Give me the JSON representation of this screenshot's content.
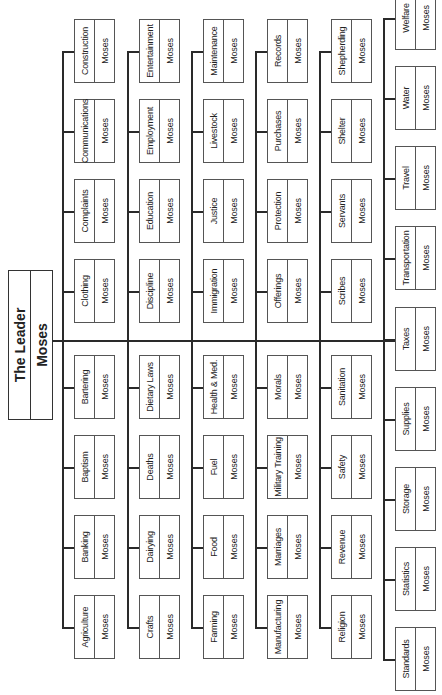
{
  "leader": {
    "title": "The Leader",
    "name": "Moses"
  },
  "columns": [
    {
      "top": [
        {
          "dept": "Construction",
          "head": "Moses"
        },
        {
          "dept": "Communications",
          "head": "Moses"
        },
        {
          "dept": "Complaints",
          "head": "Moses"
        },
        {
          "dept": "Clothing",
          "head": "Moses"
        }
      ],
      "bottom": [
        {
          "dept": "Bartering",
          "head": "Moses"
        },
        {
          "dept": "Baptism",
          "head": "Moses"
        },
        {
          "dept": "Banking",
          "head": "Moses"
        },
        {
          "dept": "Agriculture",
          "head": "Moses"
        }
      ]
    },
    {
      "top": [
        {
          "dept": "Entertainment",
          "head": "Moses"
        },
        {
          "dept": "Employment",
          "head": "Moses"
        },
        {
          "dept": "Education",
          "head": "Moses"
        },
        {
          "dept": "Discipline",
          "head": "Moses"
        }
      ],
      "bottom": [
        {
          "dept": "Dietary Laws",
          "head": "Moses"
        },
        {
          "dept": "Deaths",
          "head": "Moses"
        },
        {
          "dept": "Dairying",
          "head": "Moses"
        },
        {
          "dept": "Crafts",
          "head": "Moses"
        }
      ]
    },
    {
      "top": [
        {
          "dept": "Maintenance",
          "head": "Moses"
        },
        {
          "dept": "Livestock",
          "head": "Moses"
        },
        {
          "dept": "Justice",
          "head": "Moses"
        },
        {
          "dept": "Immigration",
          "head": "Moses"
        }
      ],
      "bottom": [
        {
          "dept": "Health & Med.",
          "head": "Moses"
        },
        {
          "dept": "Fuel",
          "head": "Moses"
        },
        {
          "dept": "Food",
          "head": "Moses"
        },
        {
          "dept": "Farming",
          "head": "Moses"
        }
      ]
    },
    {
      "top": [
        {
          "dept": "Records",
          "head": "Moses"
        },
        {
          "dept": "Purchases",
          "head": "Moses"
        },
        {
          "dept": "Protection",
          "head": "Moses"
        },
        {
          "dept": "Offerings",
          "head": "Moses"
        }
      ],
      "bottom": [
        {
          "dept": "Morals",
          "head": "Moses"
        },
        {
          "dept": "Military Training",
          "head": "Moses"
        },
        {
          "dept": "Marriages",
          "head": "Moses"
        },
        {
          "dept": "Manufacturing",
          "head": "Moses"
        }
      ]
    },
    {
      "top": [
        {
          "dept": "Shepherding",
          "head": "Moses"
        },
        {
          "dept": "Shelter",
          "head": "Moses"
        },
        {
          "dept": "Servants",
          "head": "Moses"
        },
        {
          "dept": "Scribes",
          "head": "Moses"
        }
      ],
      "bottom": [
        {
          "dept": "Sanitation",
          "head": "Moses"
        },
        {
          "dept": "Safety",
          "head": "Moses"
        },
        {
          "dept": "Revenue",
          "head": "Moses"
        },
        {
          "dept": "Religion",
          "head": "Moses"
        }
      ]
    }
  ],
  "last_column": [
    {
      "dept": "Welfare",
      "head": "Moses"
    },
    {
      "dept": "Water",
      "head": "Moses"
    },
    {
      "dept": "Travel",
      "head": "Moses"
    },
    {
      "dept": "Transportation",
      "head": "Moses"
    },
    {
      "dept": "Taxes",
      "head": "Moses"
    },
    {
      "dept": "Supplies",
      "head": "Moses"
    },
    {
      "dept": "Storage",
      "head": "Moses"
    },
    {
      "dept": "Statistics",
      "head": "Moses"
    },
    {
      "dept": "Standards",
      "head": "Moses"
    }
  ]
}
